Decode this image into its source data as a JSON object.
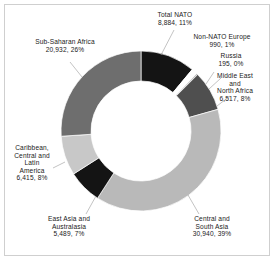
{
  "chart_data": {
    "type": "pie",
    "variant": "donut",
    "title": "",
    "subtitle": "",
    "xlabel": "",
    "ylabel": "",
    "legend_position": "none",
    "grid": false,
    "total": 80367,
    "start_angle_deg": 0,
    "direction": "clockwise",
    "categories": [
      "Total NATO",
      "Non-NATO Europe",
      "Russia",
      "Middle East and North Africa",
      "Central and South Asia",
      "East Asia and Australasia",
      "Caribbean, Central and Latin America",
      "Sub-Saharan Africa"
    ],
    "values": [
      8884,
      990,
      195,
      6517,
      30940,
      5489,
      6415,
      20932
    ],
    "percents": [
      11,
      1,
      0,
      8,
      39,
      7,
      8,
      26
    ],
    "value_labels": [
      "8,884",
      "990",
      "195",
      "6,517",
      "30,940",
      "5,489",
      "6,415",
      "20,932"
    ],
    "percent_labels": [
      "11%",
      "1%",
      "0%",
      "8%",
      "39%",
      "7%",
      "8%",
      "26%"
    ],
    "colors": [
      "#141414",
      "#ffffff",
      "#8c8c8c",
      "#4f4f4f",
      "#b9b9b9",
      "#141414",
      "#c8c8c8",
      "#6e6e6e"
    ],
    "slices": [
      {
        "name": "Total NATO",
        "value": 8884,
        "value_label": "8,884",
        "percent": 11,
        "percent_label": "11%",
        "color": "#141414",
        "label_lines": [
          "Total NATO",
          "8,884, 11%"
        ]
      },
      {
        "name": "Non-NATO Europe",
        "value": 990,
        "value_label": "990",
        "percent": 1,
        "percent_label": "1%",
        "color": "#ffffff",
        "label_lines": [
          "Non-NATO Europe",
          "990, 1%"
        ]
      },
      {
        "name": "Russia",
        "value": 195,
        "value_label": "195",
        "percent": 0,
        "percent_label": "0%",
        "color": "#8c8c8c",
        "label_lines": [
          "Russia",
          "195, 0%"
        ]
      },
      {
        "name": "Middle East and North Africa",
        "value": 6517,
        "value_label": "6,517",
        "percent": 8,
        "percent_label": "8%",
        "color": "#4f4f4f",
        "label_lines": [
          "Middle East",
          "and",
          "North Africa",
          "6,517, 8%"
        ]
      },
      {
        "name": "Central and South Asia",
        "value": 30940,
        "value_label": "30,940",
        "percent": 39,
        "percent_label": "39%",
        "color": "#b9b9b9",
        "label_lines": [
          "Central and",
          "South Asia",
          "30,940, 39%"
        ]
      },
      {
        "name": "East Asia and Australasia",
        "value": 5489,
        "value_label": "5,489",
        "percent": 7,
        "percent_label": "7%",
        "color": "#141414",
        "label_lines": [
          "East Asia and",
          "Australasia",
          "5,489, 7%"
        ]
      },
      {
        "name": "Caribbean, Central and Latin America",
        "value": 6415,
        "value_label": "6,415",
        "percent": 8,
        "percent_label": "8%",
        "color": "#c8c8c8",
        "label_lines": [
          "Caribbean,",
          "Central and",
          "Latin",
          "America",
          "6,415, 8%"
        ]
      },
      {
        "name": "Sub-Saharan Africa",
        "value": 20932,
        "value_label": "20,932",
        "percent": 26,
        "percent_label": "26%",
        "color": "#6e6e6e",
        "label_lines": [
          "Sub-Saharan Africa",
          "20,932, 26%"
        ]
      }
    ]
  },
  "labels": {
    "total_nato": {
      "l0": "Total NATO",
      "l1": "8,884, 11%"
    },
    "non_nato_europe": {
      "l0": "Non-NATO Europe",
      "l1": "990, 1%"
    },
    "russia": {
      "l0": "Russia",
      "l1": "195, 0%"
    },
    "middle_east": {
      "l0": "Middle East",
      "l1": "and",
      "l2": "North Africa",
      "l3": "6,517, 8%"
    },
    "central_south_asia": {
      "l0": "Central and",
      "l1": "South Asia",
      "l2": "30,940, 39%"
    },
    "east_asia": {
      "l0": "East Asia and",
      "l1": "Australasia",
      "l2": "5,489, 7%"
    },
    "caribbean": {
      "l0": "Caribbean,",
      "l1": "Central and",
      "l2": "Latin",
      "l3": "America",
      "l4": "6,415, 8%"
    },
    "sub_saharan": {
      "l0": "Sub-Saharan Africa",
      "l1": "20,932, 26%"
    }
  },
  "style": {
    "frame_color": "#cfcfcf",
    "background": "#ffffff",
    "text_color": "#1a1a1a",
    "leader_color": "#9a9a9a"
  }
}
